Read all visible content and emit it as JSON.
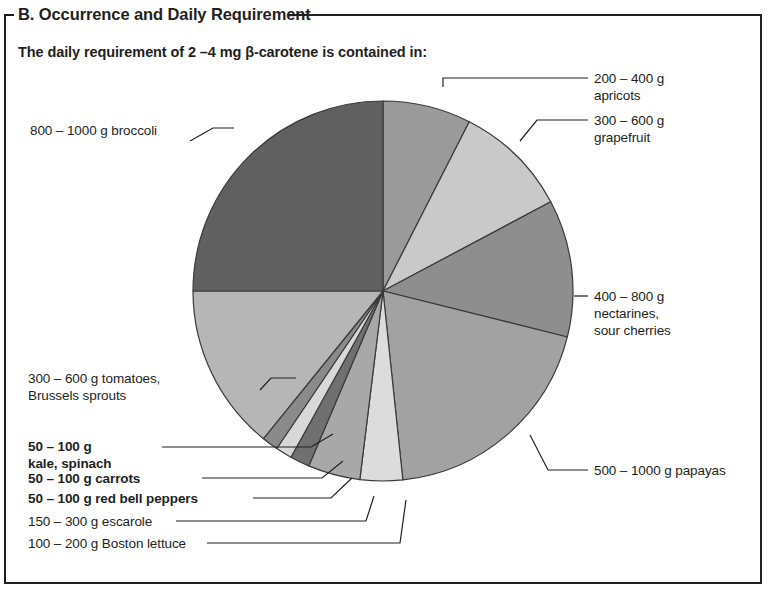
{
  "panel": {
    "title": "B. Occurrence and Daily Requirement",
    "subtitle": "The daily requirement of 2 –4 mg β-carotene is contained in:"
  },
  "chart_data": {
    "type": "pie",
    "title": "The daily requirement of 2 –4 mg β-carotene is contained in:",
    "units": "degrees of arc",
    "legend_position": "callout-labels",
    "grid": false,
    "categories": [
      "200 – 400 g apricots",
      "300 – 600 g grapefruit",
      "400 – 800 g nectarines, sour cherries",
      "500 – 1000 g papayas",
      "100 – 200 g Boston lettuce",
      "150 – 300 g escarole",
      "50 – 100 g red bell peppers",
      "50 – 100 g carrots",
      "50 – 100 g kale, spinach",
      "300 – 600 g tomatoes, Brussels sprouts",
      "800 – 1000 g broccoli"
    ],
    "values": [
      27,
      35,
      42,
      70,
      13,
      16,
      6,
      5,
      5,
      51,
      90
    ],
    "colors": [
      "#9a9a9a",
      "#c9c9c9",
      "#8e8e8e",
      "#a2a2a2",
      "#dcdcdc",
      "#a8a8a8",
      "#707070",
      "#d8d8d8",
      "#8a8a8a",
      "#b6b6b6",
      "#606060"
    ],
    "start_angle_deg": 0,
    "direction": "clockwise",
    "stroke_color": "#3a3a3a"
  },
  "labels": {
    "apricots": {
      "line1": "200 – 400 g",
      "line2": "apricots"
    },
    "grapefruit": {
      "line1": "300 – 600 g",
      "line2": "grapefruit"
    },
    "nectarines": {
      "line1": "400 – 800 g",
      "line2": "nectarines,",
      "line3": "sour cherries"
    },
    "papayas": {
      "line1": "500 – 1000 g papayas"
    },
    "broccoli": {
      "line1": "800 – 1000 g broccoli"
    },
    "tomatoes": {
      "line1": "300 – 600 g tomatoes,",
      "line2": "Brussels sprouts"
    },
    "kale": {
      "line1": "50 – 100 g",
      "line2": "kale, spinach"
    },
    "carrots": {
      "line1": "50 – 100 g carrots"
    },
    "peppers": {
      "line1": "50 – 100 g red bell peppers"
    },
    "escarole": {
      "line1": "150 – 300 g escarole"
    },
    "lettuce": {
      "line1": "100 – 200 g Boston lettuce"
    }
  }
}
